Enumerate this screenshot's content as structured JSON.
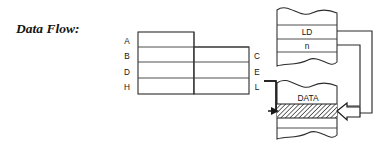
{
  "figure": {
    "caption": "Data Flow:",
    "background_color": "#ffffff",
    "ink_color": "#1a1a1a"
  },
  "register_table": {
    "name": "register-pair-table",
    "left_labels": [
      "A",
      "B",
      "D",
      "H"
    ],
    "right_labels": [
      "C",
      "E",
      "L"
    ],
    "row_count": 4,
    "has_center_divider": true,
    "note": "left column taller than right column by one row"
  },
  "memory_blocks": [
    {
      "name": "instruction-ribbon",
      "shape": "torn-page-ribbon",
      "rows": [
        {
          "label": "LD",
          "name": "ld-opcode-cell"
        },
        {
          "label": "n",
          "name": "n-operand-cell"
        }
      ]
    },
    {
      "name": "data-ribbon",
      "shape": "torn-page-ribbon",
      "rows": [
        {
          "label": "DATA",
          "name": "data-cell",
          "fill": "none"
        },
        {
          "label": "",
          "name": "data-hatched-cell",
          "fill": "hatched",
          "fill_color": "#b8b8b8"
        }
      ]
    }
  ],
  "connectors": [
    {
      "name": "ld-to-data-connector",
      "from": "ld-opcode-cell",
      "to": "data-hatched-cell",
      "style": "thin-line-elbow"
    },
    {
      "name": "n-to-data-connector",
      "from": "n-operand-cell",
      "to": "data-hatched-cell",
      "style": "thin-line-elbow"
    },
    {
      "name": "l-register-to-data-arrow",
      "from": "register-l-cell",
      "to": "data-hatched-cell",
      "style": "thin-arrow",
      "arrowhead": "solid-triangle"
    },
    {
      "name": "data-into-register-block-arrow",
      "direction": "left",
      "style": "hollow-block-arrow"
    }
  ]
}
